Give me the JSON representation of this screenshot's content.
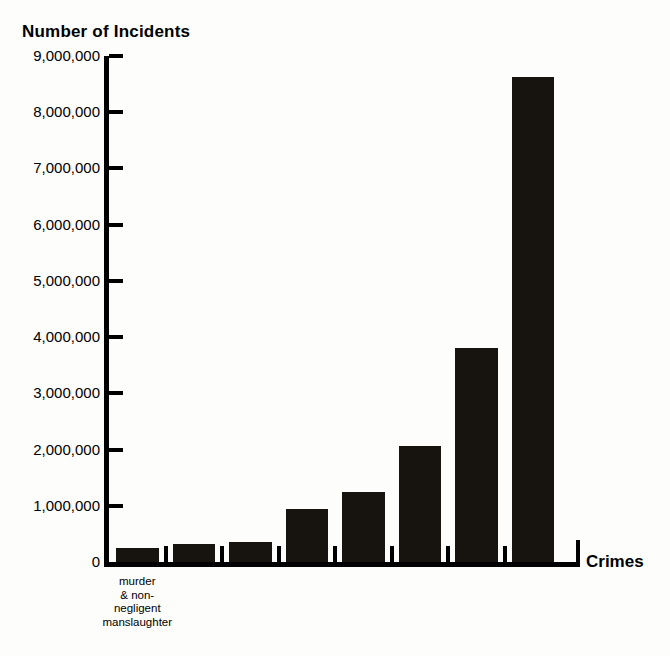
{
  "chart_data": {
    "type": "bar",
    "title": "Number of Incidents",
    "ylabel": "Number of Incidents",
    "xlabel": "Crimes",
    "grid": false,
    "legend": null,
    "ylim": [
      0,
      9000000
    ],
    "ytick_values": [
      9000000,
      8000000,
      7000000,
      6000000,
      5000000,
      4000000,
      3000000,
      2000000,
      1000000,
      0
    ],
    "ytick_labels": [
      "9,000,000",
      "8,000,000",
      "7,000,000",
      "6,000,000",
      "5,000,000",
      "4,000,000",
      "3,000,000",
      "2,000,000",
      "1,000,000",
      "0"
    ],
    "categories": [
      "murder & non-negligent manslaughter",
      "",
      "",
      "",
      "",
      "",
      "",
      ""
    ],
    "visible_category_labels": [
      {
        "index": 0,
        "lines": [
          "murder",
          "& non-",
          "negligent",
          "manslaughter"
        ]
      }
    ],
    "values": [
      250000,
      320000,
      350000,
      940000,
      1250000,
      2070000,
      3800000,
      8620000
    ],
    "bar_color": "#17140f",
    "axis_color": "#000000",
    "background_color": "#fdfdfc"
  },
  "axis": {
    "y_title": "Number of Incidents",
    "x_title": "Crimes",
    "zero_label": "0"
  }
}
